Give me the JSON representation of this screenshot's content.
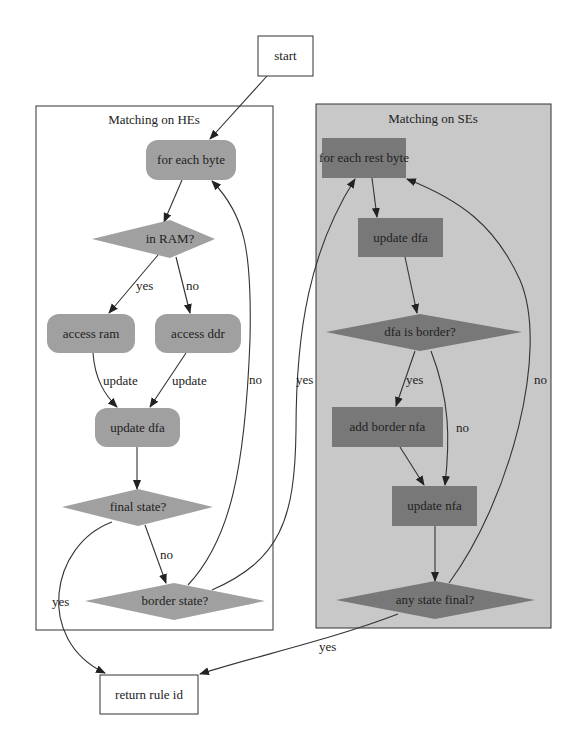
{
  "colors": {
    "background": "#ffffff",
    "he_cluster_fill": "#ffffff",
    "se_cluster_fill": "#c8c8c8",
    "he_node_fill": "#a0a0a0",
    "se_node_fill": "#787878",
    "border": "#333333"
  },
  "nodes": {
    "start": "start",
    "return_rule_id": "return rule id"
  },
  "clusters": {
    "he": {
      "title": "Matching on HEs",
      "nodes": {
        "for_each_byte": "for each byte",
        "in_ram": "in RAM?",
        "access_ram": "access ram",
        "access_ddr": "access ddr",
        "update_dfa": "update dfa",
        "final_state": "final state?",
        "border_state": "border state?"
      }
    },
    "se": {
      "title": "Matching on SEs",
      "nodes": {
        "for_each_rest_byte": "for each rest byte",
        "update_dfa": "update dfa",
        "dfa_is_border": "dfa is border?",
        "add_border_nfa": "add border nfa",
        "update_nfa": "update nfa",
        "any_state_final": "any state final?"
      }
    }
  },
  "edge_labels": {
    "in_ram_yes": "yes",
    "in_ram_no": "no",
    "ram_update": "update",
    "ddr_update": "update",
    "border_state_no": "no",
    "border_state_yes": "yes",
    "final_state_no": "no",
    "final_state_yes": "yes",
    "dfa_border_yes": "yes",
    "dfa_border_no": "no",
    "any_final_no": "no",
    "any_final_yes": "yes"
  }
}
